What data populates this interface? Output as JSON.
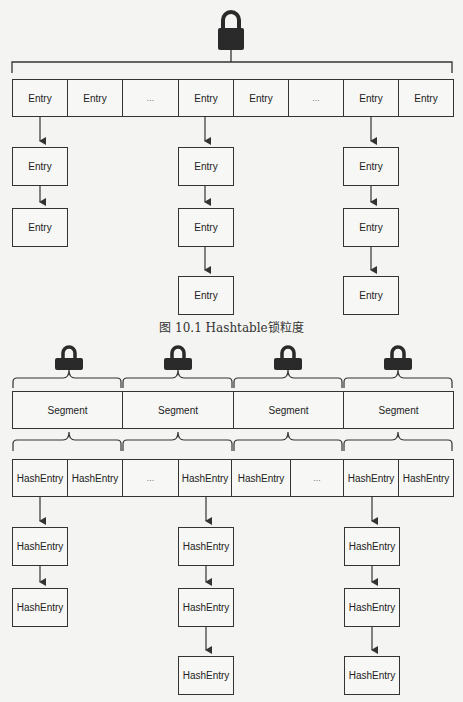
{
  "figure1": {
    "caption": "图 10.1    Hashtable锁粒度",
    "lock_icon": "lock-icon",
    "table": [
      "Entry",
      "Entry",
      "...",
      "Entry",
      "Entry",
      "...",
      "Entry",
      "Entry"
    ],
    "chains": [
      {
        "column": 0,
        "nodes": [
          "Entry",
          "Entry"
        ]
      },
      {
        "column": 3,
        "nodes": [
          "Entry",
          "Entry",
          "Entry"
        ]
      },
      {
        "column": 6,
        "nodes": [
          "Entry",
          "Entry",
          "Entry"
        ]
      }
    ]
  },
  "figure2": {
    "lock_icons": [
      "lock-icon",
      "lock-icon",
      "lock-icon",
      "lock-icon"
    ],
    "segments": [
      "Segment",
      "Segment",
      "Segment",
      "Segment"
    ],
    "table": [
      "HashEntry",
      "HashEntry",
      "...",
      "HashEntry",
      "HashEntry",
      "...",
      "HashEntry",
      "HashEntry"
    ],
    "chains": [
      {
        "column": 0,
        "nodes": [
          "HashEntry",
          "HashEntry"
        ]
      },
      {
        "column": 3,
        "nodes": [
          "HashEntry",
          "HashEntry",
          "HashEntry"
        ]
      },
      {
        "column": 6,
        "nodes": [
          "HashEntry",
          "HashEntry",
          "HashEntry"
        ]
      }
    ]
  },
  "colors": {
    "line": "#333333",
    "lock": "#2a2a2a",
    "background": "#f4f4f2"
  }
}
